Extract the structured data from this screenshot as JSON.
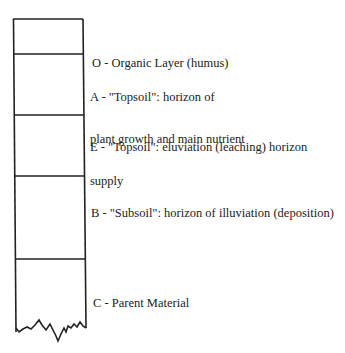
{
  "diagram": {
    "stroke_color": "#222222",
    "horizons": [
      {
        "code": "O",
        "label_lines": [
          "O - Organic Layer (humus)"
        ]
      },
      {
        "code": "A",
        "label_lines": [
          "A - \"Topsoil\": horizon of",
          "plant growth and main nutrient",
          "supply"
        ]
      },
      {
        "code": "E",
        "label_lines": [
          "E - \"Topsoil\": eluviation (leaching) horizon"
        ]
      },
      {
        "code": "B",
        "label_lines": [
          "B - \"Subsoil\": horizon of illuviation (deposition)"
        ]
      },
      {
        "code": "C",
        "label_lines": [
          "C - Parent Material"
        ]
      }
    ]
  }
}
